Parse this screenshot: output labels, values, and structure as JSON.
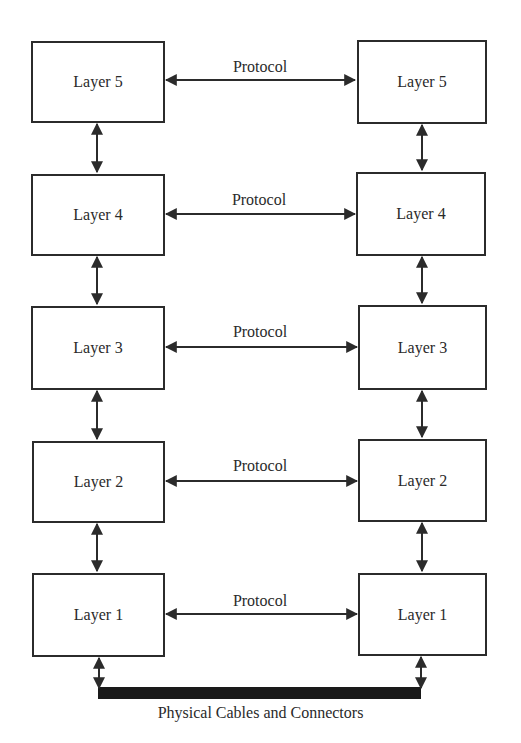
{
  "diagram": {
    "type": "layered-protocol-stack",
    "left_stack": [
      {
        "label": "Layer 5"
      },
      {
        "label": "Layer 4"
      },
      {
        "label": "Layer 3"
      },
      {
        "label": "Layer 2"
      },
      {
        "label": "Layer 1"
      }
    ],
    "right_stack": [
      {
        "label": "Layer 5"
      },
      {
        "label": "Layer 4"
      },
      {
        "label": "Layer 3"
      },
      {
        "label": "Layer 2"
      },
      {
        "label": "Layer 1"
      }
    ],
    "protocols": [
      {
        "label": "Protocol"
      },
      {
        "label": "Protocol"
      },
      {
        "label": "Protocol"
      },
      {
        "label": "Protocol"
      },
      {
        "label": "Protocol"
      }
    ],
    "physical_link": {
      "label": "Physical Cables and Connectors"
    },
    "colors": {
      "line": "#2b2b2b",
      "background": "#ffffff",
      "cable": "#1a1a1a"
    }
  }
}
